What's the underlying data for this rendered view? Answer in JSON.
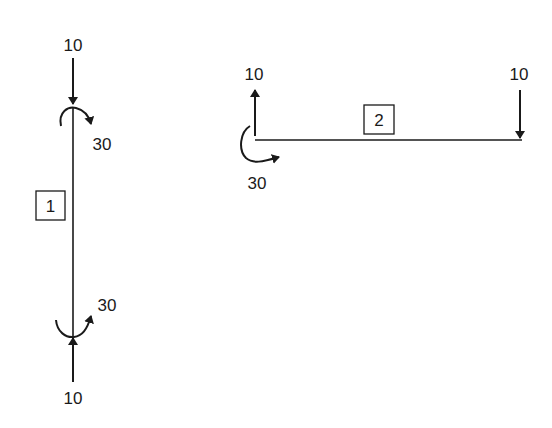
{
  "members": [
    {
      "id": "1",
      "orientation": "vertical",
      "top_force": "10",
      "top_moment": "30",
      "bottom_force": "10",
      "bottom_moment": "30"
    },
    {
      "id": "2",
      "orientation": "horizontal",
      "left_force": "10",
      "left_moment": "30",
      "right_force": "10"
    }
  ],
  "colors": {
    "stroke": "#1a1a1a",
    "background": "#ffffff"
  }
}
